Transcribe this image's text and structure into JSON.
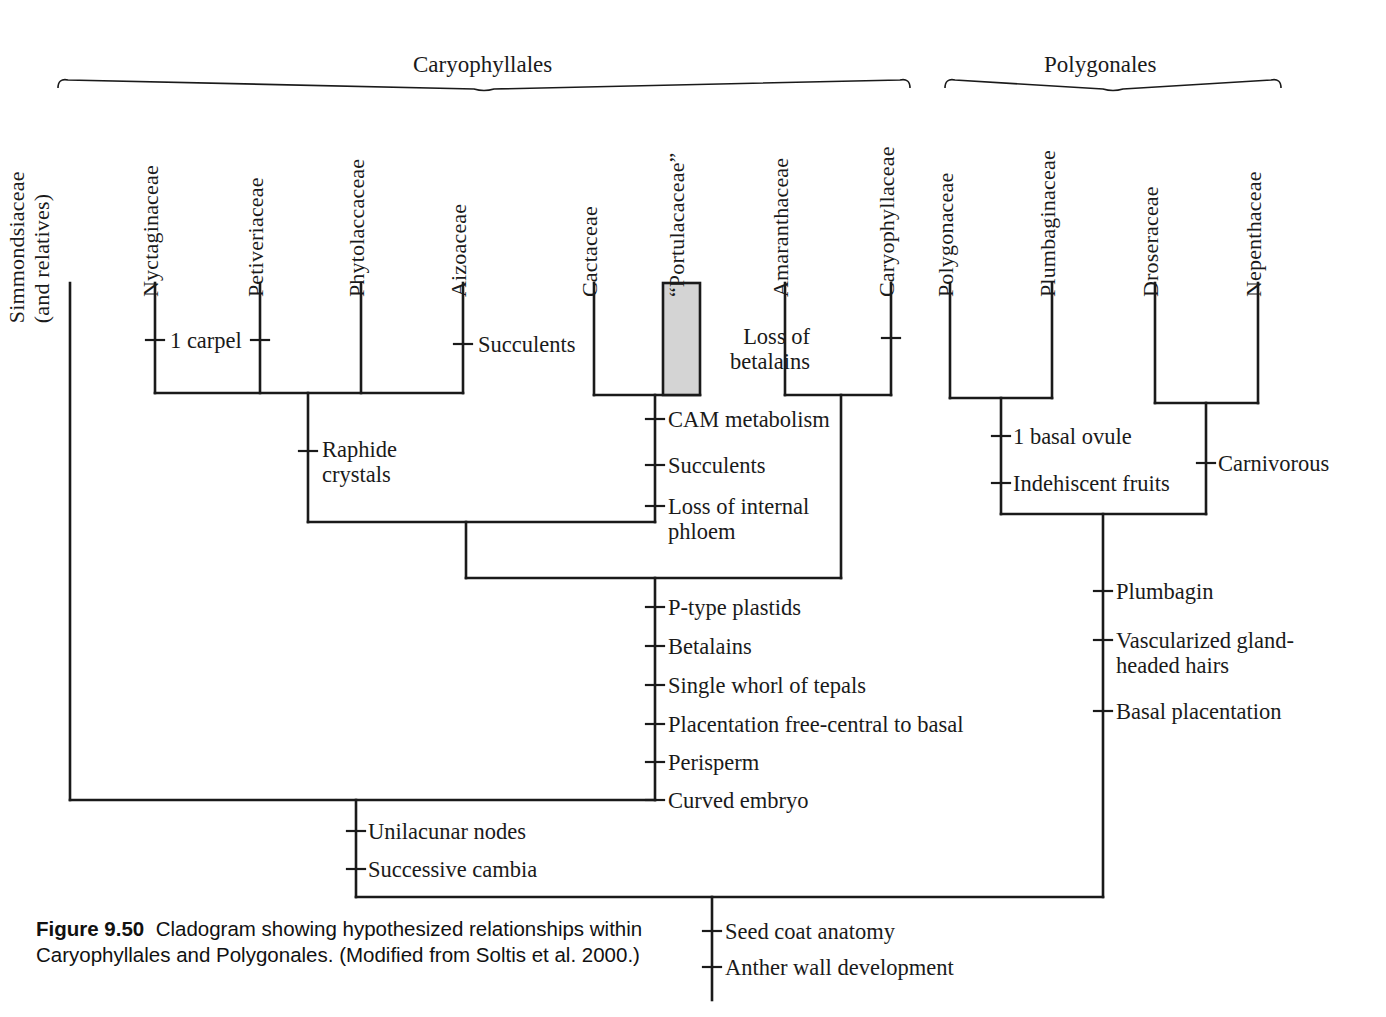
{
  "figure": {
    "number_label": "Figure 9.50",
    "caption_text": "Cladogram showing hypothesized relationships within Caryophyllales and Polygonales. (Modified from Soltis et al. 2000.)"
  },
  "clade_brackets": [
    {
      "id": "caryophyllales",
      "label": "Caryophyllales",
      "x_start": 58,
      "x_end": 910,
      "label_x": 413,
      "label_y": 52
    },
    {
      "id": "polygonales",
      "label": "Polygonales",
      "x_start": 945,
      "x_end": 1281,
      "label_x": 1044,
      "label_y": 52
    }
  ],
  "taxa": [
    {
      "id": "simmondsiaceae",
      "label": "Simmondsiaceae",
      "label2": "(and relatives)",
      "x": 70,
      "tip_y": 283,
      "base_y": 800
    },
    {
      "id": "nyctaginaceae",
      "label": "Nyctaginaceae",
      "label2": "",
      "x": 155,
      "tip_y": 283,
      "base_y": 393
    },
    {
      "id": "petiveriaceae",
      "label": "Petiveriaceae",
      "label2": "",
      "x": 260,
      "tip_y": 283,
      "base_y": 393
    },
    {
      "id": "phytolaccaceae",
      "label": "Phytolaccaceae",
      "label2": "",
      "x": 361,
      "tip_y": 283,
      "base_y": 393
    },
    {
      "id": "aizoaceae",
      "label": "Aizoaceae",
      "label2": "",
      "x": 463,
      "tip_y": 283,
      "base_y": 393
    },
    {
      "id": "cactaceae",
      "label": "Cactaceae",
      "label2": "",
      "x": 594,
      "tip_y": 283,
      "base_y": 395
    },
    {
      "id": "portulacaceae",
      "label": "“Portulacaceae”",
      "label2": "",
      "x": 681,
      "tip_y": 283,
      "base_y": 395
    },
    {
      "id": "amaranthaceae",
      "label": "Amaranthaceae",
      "label2": "",
      "x": 785,
      "tip_y": 283,
      "base_y": 395
    },
    {
      "id": "caryophyllaceae",
      "label": "Caryophyllaceae",
      "label2": "",
      "x": 891,
      "tip_y": 283,
      "base_y": 395
    },
    {
      "id": "polygonaceae",
      "label": "Polygonaceae",
      "label2": "",
      "x": 950,
      "tip_y": 283,
      "base_y": 398
    },
    {
      "id": "plumbaginaceae",
      "label": "Plumbaginaceae",
      "label2": "",
      "x": 1052,
      "tip_y": 283,
      "base_y": 398
    },
    {
      "id": "droseraceae",
      "label": "Droseraceae",
      "label2": "",
      "x": 1155,
      "tip_y": 283,
      "base_y": 403
    },
    {
      "id": "nepenthaceae",
      "label": "Nepenthaceae",
      "label2": "",
      "x": 1258,
      "tip_y": 283,
      "base_y": 403
    }
  ],
  "paraphyletic_box": {
    "taxon": "portulacaceae",
    "x": 663,
    "y": 283,
    "width": 37,
    "height": 112,
    "fill": "#d4d4d4",
    "stroke": "#1a1a1a"
  },
  "nodes": [
    {
      "id": "node-nyct-aizo",
      "x_left": 155,
      "x_right": 463,
      "y": 393,
      "stem_x": 308,
      "stem_y_end": 522
    },
    {
      "id": "node-cact-portu",
      "x_left": 594,
      "x_right": 700,
      "y": 395,
      "stem_x": 655,
      "stem_y_end": 522
    },
    {
      "id": "node-amar-caryo",
      "x_left": 785,
      "x_right": 891,
      "y": 395,
      "stem_x": 841,
      "stem_y_end": 578
    },
    {
      "id": "node-core-caryo",
      "x_left": 308,
      "x_right": 655,
      "y": 522,
      "stem_x": 466,
      "stem_y_end": 578
    },
    {
      "id": "node-caryophyllales",
      "x_left": 466,
      "x_right": 841,
      "y": 578,
      "stem_x": 655,
      "stem_y_end": 800
    },
    {
      "id": "node-simmonds-sister",
      "x_left": 70,
      "x_right": 655,
      "y": 800,
      "stem_x": 356,
      "stem_y_end": 897
    },
    {
      "id": "node-polyg-plumb",
      "x_left": 950,
      "x_right": 1052,
      "y": 398,
      "stem_x": 1001,
      "stem_y_end": 514
    },
    {
      "id": "node-dros-nepen",
      "x_left": 1155,
      "x_right": 1258,
      "y": 403,
      "stem_x": 1206,
      "stem_y_end": 514
    },
    {
      "id": "node-polygonales",
      "x_left": 1001,
      "x_right": 1206,
      "y": 514,
      "stem_x": 1103,
      "stem_y_end": 897
    },
    {
      "id": "node-root",
      "x_left": 356,
      "x_right": 1103,
      "y": 897,
      "stem_x": 712,
      "stem_y_end": 1000
    }
  ],
  "character_marks": [
    {
      "id": "ch-1-carpel-left",
      "x": 155,
      "y": 340,
      "label": "1 carpel",
      "side": "right",
      "label_x": 170,
      "label_y": 328,
      "tick": "h"
    },
    {
      "id": "ch-1-carpel-right",
      "x": 260,
      "y": 340,
      "label": "",
      "side": "none",
      "label_x": 0,
      "label_y": 0,
      "tick": "h"
    },
    {
      "id": "ch-succulents-aiz",
      "x": 463,
      "y": 344,
      "label": "Succulents",
      "side": "right",
      "label_x": 478,
      "label_y": 332,
      "tick": "h"
    },
    {
      "id": "ch-loss-betalains",
      "x": 891,
      "y": 338,
      "label": "Loss of\nbetalains",
      "side": "left",
      "label_x": 810,
      "label_y": 324,
      "tick": "h"
    },
    {
      "id": "ch-raphide",
      "x": 308,
      "y": 451,
      "label": "Raphide\ncrystals",
      "side": "right",
      "label_x": 322,
      "label_y": 437,
      "tick": "h"
    },
    {
      "id": "ch-cam",
      "x": 655,
      "y": 419,
      "label": "CAM metabolism",
      "side": "right",
      "label_x": 668,
      "label_y": 407,
      "tick": "h"
    },
    {
      "id": "ch-succulents-cam",
      "x": 655,
      "y": 465,
      "label": "Succulents",
      "side": "right",
      "label_x": 668,
      "label_y": 453,
      "tick": "h"
    },
    {
      "id": "ch-loss-phloem",
      "x": 655,
      "y": 506,
      "label": "Loss of internal\nphloem",
      "side": "right",
      "label_x": 668,
      "label_y": 494,
      "tick": "h"
    },
    {
      "id": "ch-1-basal-ovule",
      "x": 1001,
      "y": 436,
      "label": "1 basal ovule",
      "side": "right",
      "label_x": 1013,
      "label_y": 424,
      "tick": "h"
    },
    {
      "id": "ch-indehiscent",
      "x": 1001,
      "y": 483,
      "label": "Indehiscent fruits",
      "side": "right",
      "label_x": 1013,
      "label_y": 471,
      "tick": "h"
    },
    {
      "id": "ch-carnivorous",
      "x": 1206,
      "y": 463,
      "label": "Carnivorous",
      "side": "right",
      "label_x": 1218,
      "label_y": 451,
      "tick": "h"
    },
    {
      "id": "ch-p-type",
      "x": 655,
      "y": 607,
      "label": "P-type plastids",
      "side": "right",
      "label_x": 668,
      "label_y": 595,
      "tick": "h"
    },
    {
      "id": "ch-betalains",
      "x": 655,
      "y": 646,
      "label": "Betalains",
      "side": "right",
      "label_x": 668,
      "label_y": 634,
      "tick": "h"
    },
    {
      "id": "ch-single-whorl",
      "x": 655,
      "y": 685,
      "label": "Single whorl of tepals",
      "side": "right",
      "label_x": 668,
      "label_y": 673,
      "tick": "h"
    },
    {
      "id": "ch-placentation",
      "x": 655,
      "y": 724,
      "label": "Placentation free-central to basal",
      "side": "right",
      "label_x": 668,
      "label_y": 712,
      "tick": "h"
    },
    {
      "id": "ch-perisperm",
      "x": 655,
      "y": 762,
      "label": "Perisperm",
      "side": "right",
      "label_x": 668,
      "label_y": 750,
      "tick": "h"
    },
    {
      "id": "ch-curved-embryo",
      "x": 655,
      "y": 800,
      "label": "Curved embryo",
      "side": "right",
      "label_x": 668,
      "label_y": 788,
      "tick": "h"
    },
    {
      "id": "ch-plumbagin",
      "x": 1103,
      "y": 591,
      "label": "Plumbagin",
      "side": "right",
      "label_x": 1116,
      "label_y": 579,
      "tick": "h"
    },
    {
      "id": "ch-vascularized",
      "x": 1103,
      "y": 640,
      "label": "Vascularized gland-\nheaded hairs",
      "side": "right",
      "label_x": 1116,
      "label_y": 628,
      "tick": "h"
    },
    {
      "id": "ch-basal-plac",
      "x": 1103,
      "y": 711,
      "label": "Basal placentation",
      "side": "right",
      "label_x": 1116,
      "label_y": 699,
      "tick": "h"
    },
    {
      "id": "ch-unilacunar",
      "x": 356,
      "y": 831,
      "label": "Unilacunar nodes",
      "side": "right",
      "label_x": 368,
      "label_y": 819,
      "tick": "h"
    },
    {
      "id": "ch-succ-cambia",
      "x": 356,
      "y": 869,
      "label": "Successive cambia",
      "side": "right",
      "label_x": 368,
      "label_y": 857,
      "tick": "h"
    },
    {
      "id": "ch-seed-coat",
      "x": 712,
      "y": 931,
      "label": "Seed coat anatomy",
      "side": "right",
      "label_x": 725,
      "label_y": 919,
      "tick": "h"
    },
    {
      "id": "ch-anther-wall",
      "x": 712,
      "y": 967,
      "label": "Anther wall development",
      "side": "right",
      "label_x": 725,
      "label_y": 955,
      "tick": "h"
    }
  ],
  "style": {
    "line_color": "#1a1a1a",
    "line_width": 2.6,
    "background": "#ffffff"
  },
  "chart_data": {
    "type": "diagram",
    "subtype": "cladogram",
    "title": "Cladogram showing hypothesized relationships within Caryophyllales and Polygonales",
    "source": "Modified from Soltis et al. 2000",
    "terminal_taxa": [
      "Simmondsiaceae (and relatives)",
      "Nyctaginaceae",
      "Petiveriaceae",
      "Phytolaccaceae",
      "Aizoaceae",
      "Cactaceae",
      "“Portulacaceae”",
      "Amaranthaceae",
      "Caryophyllaceae",
      "Polygonaceae",
      "Plumbaginaceae",
      "Droseraceae",
      "Nepenthaceae"
    ],
    "higher_clades": [
      "Caryophyllales",
      "Polygonales"
    ],
    "newick": "(Simmondsiaceae,((((Nyctaginaceae,Petiveriaceae,Phytolaccaceae,Aizoaceae),(Cactaceae,\"Portulacaceae\")),(Amaranthaceae,Caryophyllaceae))),((Polygonaceae,Plumbaginaceae),(Droseraceae,Nepenthaceae)))",
    "synapomorphies": [
      {
        "clade": "Nyctaginaceae + Petiveriaceae",
        "characters": [
          "1 carpel"
        ]
      },
      {
        "clade": "Aizoaceae",
        "characters": [
          "Succulents"
        ]
      },
      {
        "clade": "Caryophyllaceae",
        "characters": [
          "Loss of betalains"
        ]
      },
      {
        "clade": "Nyctaginaceae–Aizoaceae clade",
        "characters": [
          "Raphide crystals"
        ]
      },
      {
        "clade": "Cactaceae + “Portulacaceae”",
        "characters": [
          "CAM metabolism",
          "Succulents",
          "Loss of internal phloem"
        ]
      },
      {
        "clade": "Polygonaceae + Plumbaginaceae",
        "characters": [
          "1 basal ovule",
          "Indehiscent fruits"
        ]
      },
      {
        "clade": "Droseraceae + Nepenthaceae",
        "characters": [
          "Carnivorous"
        ]
      },
      {
        "clade": "Caryophyllales core",
        "characters": [
          "P-type plastids",
          "Betalains",
          "Single whorl of tepals",
          "Placentation free-central to basal",
          "Perisperm",
          "Curved embryo"
        ]
      },
      {
        "clade": "Polygonales",
        "characters": [
          "Plumbagin",
          "Vascularized gland-headed hairs",
          "Basal placentation"
        ]
      },
      {
        "clade": "Caryophyllales incl. Simmondsiaceae",
        "characters": [
          "Unilacunar nodes",
          "Successive cambia"
        ]
      },
      {
        "clade": "Caryophyllales + Polygonales (root)",
        "characters": [
          "Seed coat anatomy",
          "Anther wall development"
        ]
      }
    ],
    "annotations": [
      {
        "text": "“Portulacaceae” is shaded to indicate a paraphyletic group"
      }
    ]
  }
}
